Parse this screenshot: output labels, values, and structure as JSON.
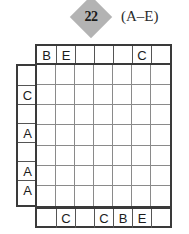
{
  "header": {
    "badge_number": "22",
    "range_label": "(A–E)",
    "badge_color": "#b3b3b3"
  },
  "puzzle": {
    "grid_size": 7,
    "letters": [
      "A",
      "B",
      "C",
      "D",
      "E"
    ],
    "clues_top": [
      "B",
      "E",
      "",
      "",
      "",
      "C",
      ""
    ],
    "clues_bottom": [
      "",
      "C",
      "",
      "C",
      "B",
      "E",
      ""
    ],
    "clues_left": [
      "",
      "C",
      "",
      "A",
      "",
      "A",
      "A"
    ],
    "clues_right": [
      "A",
      "A",
      "C",
      "C",
      "B",
      "",
      "E"
    ],
    "cells": [
      [
        "",
        "",
        "",
        "",
        "",
        "",
        ""
      ],
      [
        "",
        "",
        "",
        "",
        "",
        "",
        ""
      ],
      [
        "",
        "",
        "",
        "",
        "",
        "",
        ""
      ],
      [
        "",
        "",
        "",
        "",
        "",
        "",
        ""
      ],
      [
        "",
        "",
        "",
        "",
        "",
        "",
        ""
      ],
      [
        "",
        "",
        "",
        "",
        "",
        "",
        ""
      ],
      [
        "",
        "",
        "",
        "",
        "",
        "",
        ""
      ]
    ]
  }
}
